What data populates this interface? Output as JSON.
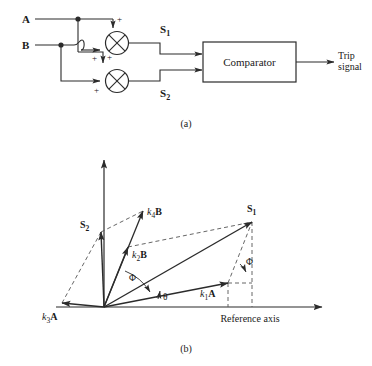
{
  "figure": {
    "caption_a": "(a)",
    "caption_b": "(b)"
  },
  "block_diagram": {
    "input_a": "A",
    "input_b": "B",
    "mixer_top_plus_1": "+",
    "mixer_top_plus_2": "+",
    "mixer_bottom_plus_1": "+",
    "mixer_bottom_plus_2": "+",
    "signal_1": "S",
    "signal_1_sub": "1",
    "signal_2": "S",
    "signal_2_sub": "2",
    "comparator_label": "Comparator",
    "output_line_1": "Trip",
    "output_line_2": "signal"
  },
  "phasor_diagram": {
    "reference_axis_label": "Reference axis",
    "vectors": [
      {
        "name": "k1A",
        "k": "k",
        "sub": "1",
        "vec": "A"
      },
      {
        "name": "k2B",
        "k": "k",
        "sub": "2",
        "vec": "B"
      },
      {
        "name": "k3A",
        "k": "k",
        "sub": "3",
        "vec": "A"
      },
      {
        "name": "k4B",
        "k": "k",
        "sub": "4",
        "vec": "B"
      }
    ],
    "resultant_1": "S",
    "resultant_1_sub": "1",
    "resultant_2": "S",
    "resultant_2_sub": "2",
    "angle_phi_left": "Φ",
    "angle_phi_right": "Φ",
    "angle_theta": "θ"
  },
  "colors": {
    "line": "#2b2b2b",
    "dashed": "#555555",
    "text": "#1a1a1a",
    "background": "#ffffff"
  }
}
